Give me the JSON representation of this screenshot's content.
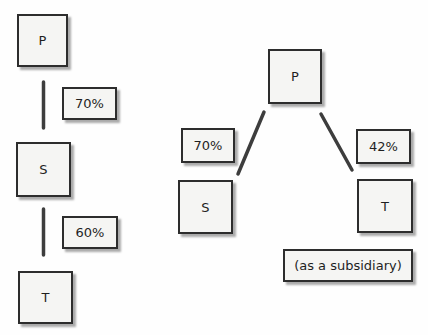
{
  "left_diagram": {
    "nodes": [
      {
        "id": "P",
        "label": "P"
      },
      {
        "id": "S",
        "label": "S"
      },
      {
        "id": "T",
        "label": "T"
      }
    ],
    "edges": [
      {
        "from": "P",
        "to": "S",
        "label": "70%"
      },
      {
        "from": "S",
        "to": "T",
        "label": "60%"
      }
    ]
  },
  "right_diagram": {
    "nodes": [
      {
        "id": "P",
        "label": "P"
      },
      {
        "id": "S",
        "label": "S"
      },
      {
        "id": "T",
        "label": "T"
      }
    ],
    "edges": [
      {
        "from": "P",
        "to": "S",
        "label": "70%"
      },
      {
        "from": "P",
        "to": "T",
        "label": "42%"
      }
    ],
    "note": "(as a subsidiary)"
  },
  "colors": {
    "background": "#fefefe",
    "box_fill": "#f5f5f3",
    "box_border": "#2d2d2d",
    "connector": "#3d3d3d",
    "text": "#1f1f1f"
  }
}
